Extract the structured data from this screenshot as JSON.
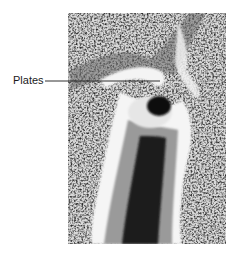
{
  "figure": {
    "type": "grayscale histology micrograph",
    "annotations": [
      {
        "label": "Plates",
        "leader_line": true
      }
    ]
  },
  "colors": {
    "background": "#ffffff",
    "label_text": "#1a1a1a",
    "leader_line": "#1a1a1a"
  }
}
